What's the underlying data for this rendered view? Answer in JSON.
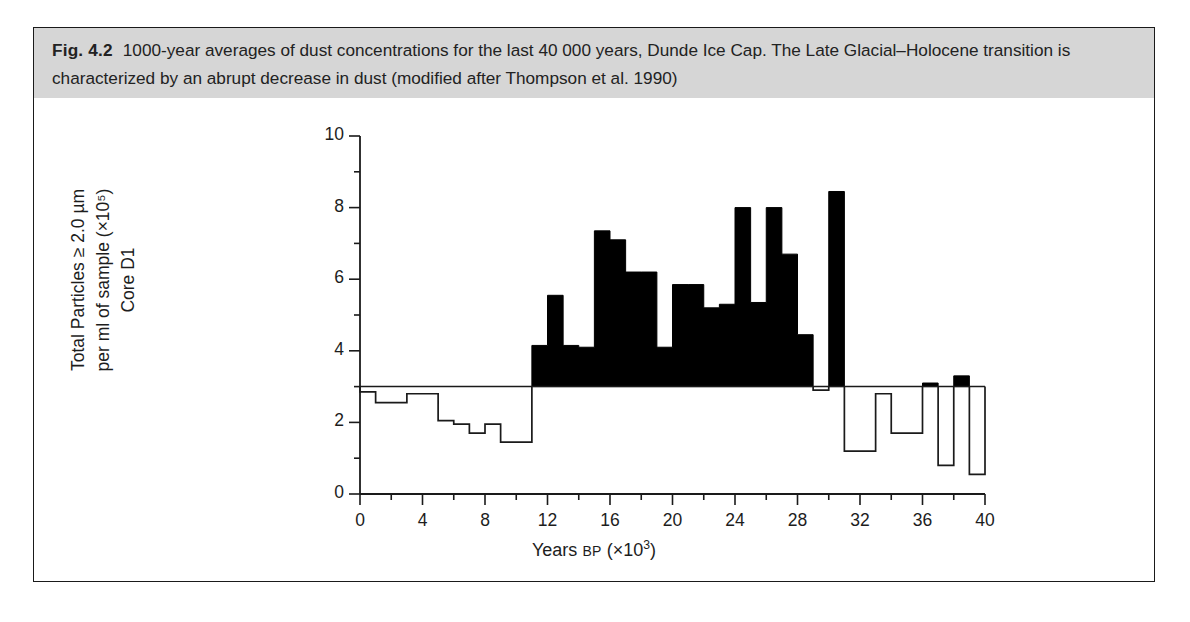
{
  "figure": {
    "label": "Fig. 4.2",
    "caption": "1000-year averages of dust concentrations for the last 40 000 years, Dunde Ice Cap. The Late Glacial–Holocene transition is characterized by an abrupt decrease in dust (modified after Thompson et al. 1990)",
    "background_color": "#ffffff",
    "caption_background_color": "#d6d6d6",
    "border_color": "#1a1a1a",
    "data_color": "#000000"
  },
  "chart_data": {
    "type": "bar",
    "title": "",
    "subtitle": "",
    "xlabel": "Years BP (×10³)",
    "xlabel_main": "Years",
    "xlabel_smallcaps": "BP",
    "xlabel_suffix": "(×10",
    "xlabel_exponent": "3",
    "xlabel_close": ")",
    "ylabel": "Total Particles ≥ 2.0 µm per ml of sample (×10⁵) Core D1",
    "ylabel_line1": "Total Particles ≥ 2.0 µm",
    "ylabel_line2": "per ml of sample (×10⁵)",
    "ylabel_line3": "Core D1",
    "xlim": [
      0,
      40
    ],
    "ylim": [
      0,
      10
    ],
    "xticks": [
      0,
      4,
      8,
      12,
      16,
      20,
      24,
      28,
      32,
      36,
      40
    ],
    "xtick_labels": [
      "0",
      "4",
      "8",
      "12",
      "16",
      "20",
      "24",
      "28",
      "32",
      "36",
      "40"
    ],
    "xminor_step": 2,
    "yticks": [
      0,
      2,
      4,
      6,
      8,
      10
    ],
    "ytick_labels": [
      "0",
      "2",
      "4",
      "6",
      "8",
      "10"
    ],
    "yminor_step": 1,
    "grid": false,
    "legend": null,
    "bin_width": 1,
    "threshold": 3,
    "threshold_note": "Bars above 3 are filled solid black; bars at or below 3 are drawn as open outlines.",
    "categories": [
      "0-1",
      "1-2",
      "2-3",
      "3-4",
      "4-5",
      "5-6",
      "6-7",
      "7-8",
      "8-9",
      "9-10",
      "10-11",
      "11-12",
      "12-13",
      "13-14",
      "14-15",
      "15-16",
      "16-17",
      "17-18",
      "18-19",
      "19-20",
      "20-21",
      "21-22",
      "22-23",
      "23-24",
      "24-25",
      "25-26",
      "26-27",
      "27-28",
      "28-29",
      "29-30",
      "30-31",
      "31-32",
      "32-33",
      "33-34",
      "34-35",
      "35-36",
      "36-37",
      "37-38",
      "38-39",
      "39-40"
    ],
    "x": [
      0.5,
      1.5,
      2.5,
      3.5,
      4.5,
      5.5,
      6.5,
      7.5,
      8.5,
      9.5,
      10.5,
      11.5,
      12.5,
      13.5,
      14.5,
      15.5,
      16.5,
      17.5,
      18.5,
      19.5,
      20.5,
      21.5,
      22.5,
      23.5,
      24.5,
      25.5,
      26.5,
      27.5,
      28.5,
      29.5,
      30.5,
      31.5,
      32.5,
      33.5,
      34.5,
      35.5,
      36.5,
      37.5,
      38.5,
      39.5
    ],
    "values": [
      2.85,
      2.55,
      2.55,
      2.8,
      2.8,
      2.05,
      1.95,
      1.7,
      1.95,
      1.45,
      1.45,
      4.15,
      5.55,
      4.15,
      4.1,
      7.35,
      7.1,
      6.2,
      6.2,
      4.1,
      5.85,
      5.85,
      5.2,
      5.3,
      8.0,
      5.35,
      8.0,
      6.7,
      4.45,
      2.9,
      8.45,
      1.2,
      1.2,
      2.8,
      1.7,
      1.7,
      3.1,
      0.8,
      3.3,
      0.55
    ],
    "series": [
      {
        "name": "Total Particles ≥ 2.0 µm per ml of sample (×10⁵), Core D1",
        "values": [
          2.85,
          2.55,
          2.55,
          2.8,
          2.8,
          2.05,
          1.95,
          1.7,
          1.95,
          1.45,
          1.45,
          4.15,
          5.55,
          4.15,
          4.1,
          7.35,
          7.1,
          6.2,
          6.2,
          4.1,
          5.85,
          5.85,
          5.2,
          5.3,
          8.0,
          5.35,
          8.0,
          6.7,
          4.45,
          2.9,
          8.45,
          1.2,
          1.2,
          2.8,
          1.7,
          1.7,
          3.1,
          0.8,
          3.3,
          0.55
        ]
      }
    ]
  }
}
